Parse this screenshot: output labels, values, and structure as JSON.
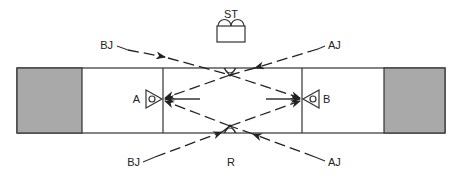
{
  "diagram": {
    "labels": {
      "station": "ST",
      "speaker_a": "A",
      "speaker_b": "B",
      "bj_top": "BJ",
      "aj_top": "AJ",
      "bj_bottom": "BJ",
      "aj_bottom": "AJ",
      "receiver": "R"
    },
    "colors": {
      "line": "#333333",
      "block_fill": "#a9a9a9",
      "background": "#ffffff"
    }
  }
}
